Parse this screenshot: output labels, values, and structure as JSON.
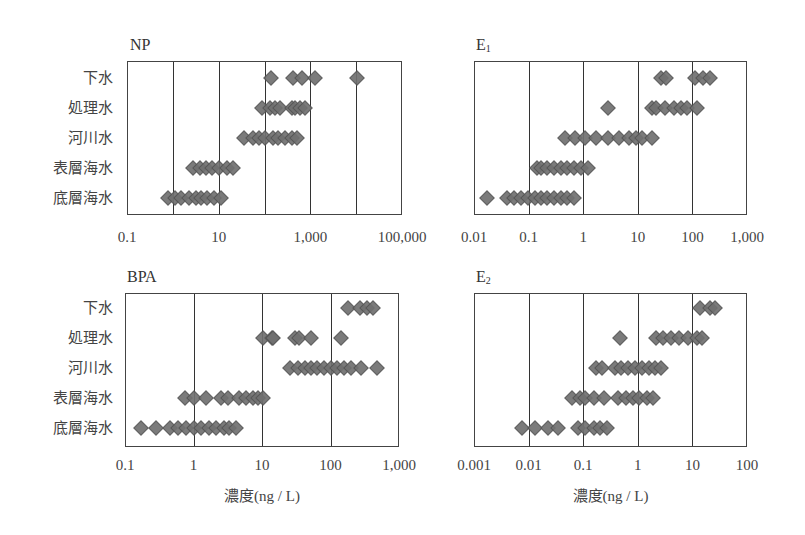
{
  "chart_data": [
    {
      "type": "scatter",
      "title": "NP",
      "xscale": "log",
      "xlim": [
        0.1,
        100000
      ],
      "xticks": [
        "0.1",
        "10",
        "1,000",
        "100,000"
      ],
      "gridlines": [
        0.1,
        1,
        10,
        100,
        1000,
        10000,
        100000
      ],
      "xlabel": "",
      "categories": [
        "下水",
        "処理水",
        "河川水",
        "表層海水",
        "底層海水"
      ],
      "series": [
        {
          "name": "下水",
          "values": [
            140,
            420,
            660,
            1260,
            10500
          ]
        },
        {
          "name": "処理水",
          "values": [
            90,
            130,
            170,
            220,
            400,
            470,
            600,
            770
          ]
        },
        {
          "name": "河川水",
          "values": [
            35,
            55,
            74,
            105,
            150,
            200,
            280,
            400,
            510
          ]
        },
        {
          "name": "表層海水",
          "values": [
            2.7,
            3.9,
            5.2,
            7.3,
            10,
            15,
            21
          ]
        },
        {
          "name": "底層海水",
          "values": [
            0.8,
            1.1,
            1.5,
            2.2,
            3.2,
            4.1,
            5.7,
            7.8,
            11
          ]
        }
      ]
    },
    {
      "type": "scatter",
      "title": "E1",
      "xscale": "log",
      "xlim": [
        0.01,
        1000
      ],
      "xticks": [
        "0.01",
        "0.1",
        "1",
        "10",
        "100",
        "1,000"
      ],
      "gridlines": [
        0.01,
        0.1,
        1,
        10,
        100,
        1000
      ],
      "xlabel": "",
      "categories": [
        "下水",
        "処理水",
        "河川水",
        "表層海水",
        "底層海水"
      ],
      "series": [
        {
          "name": "下水",
          "values": [
            27,
            33,
            110,
            155,
            210
          ]
        },
        {
          "name": "処理水",
          "values": [
            2.9,
            18,
            22,
            31,
            47,
            63,
            81,
            120
          ]
        },
        {
          "name": "河川水",
          "values": [
            0.46,
            0.7,
            1.1,
            1.7,
            2.8,
            4.6,
            7.0,
            9.1,
            12,
            18
          ]
        },
        {
          "name": "表層海水",
          "values": [
            0.14,
            0.17,
            0.22,
            0.29,
            0.39,
            0.5,
            0.68,
            0.91,
            1.2
          ]
        },
        {
          "name": "底層海水",
          "values": [
            0.017,
            0.041,
            0.055,
            0.074,
            0.096,
            0.13,
            0.17,
            0.22,
            0.29,
            0.39,
            0.5,
            0.68
          ]
        }
      ]
    },
    {
      "type": "scatter",
      "title": "BPA",
      "xscale": "log",
      "xlim": [
        0.1,
        1000
      ],
      "xticks": [
        "0.1",
        "1",
        "10",
        "100",
        "1,000"
      ],
      "gridlines": [
        0.1,
        1,
        10,
        100,
        1000
      ],
      "xlabel": "濃度(ng / L)",
      "categories": [
        "下水",
        "処理水",
        "河川水",
        "表層海水",
        "底層海水"
      ],
      "series": [
        {
          "name": "下水",
          "values": [
            180,
            270,
            340,
            420
          ]
        },
        {
          "name": "処理水",
          "values": [
            10.5,
            14,
            14.5,
            30,
            35,
            52,
            140
          ]
        },
        {
          "name": "河川水",
          "values": [
            26,
            33,
            43,
            52,
            64,
            80,
            100,
            125,
            160,
            200,
            280,
            480
          ]
        },
        {
          "name": "表層海水",
          "values": [
            0.76,
            1.0,
            1.5,
            2.5,
            3.2,
            4.6,
            5.8,
            7.3,
            8.6,
            10.5
          ]
        },
        {
          "name": "底層海水",
          "values": [
            0.17,
            0.28,
            0.46,
            0.6,
            0.79,
            1.0,
            1.3,
            1.7,
            2.1,
            2.8,
            3.3,
            4.2
          ]
        }
      ]
    },
    {
      "type": "scatter",
      "title": "E2",
      "xscale": "log",
      "xlim": [
        0.001,
        100
      ],
      "xticks": [
        "0.001",
        "0.01",
        "0.1",
        "1",
        "10",
        "100"
      ],
      "gridlines": [
        0.001,
        0.01,
        0.1,
        1,
        10,
        100
      ],
      "xlabel": "濃度(ng / L)",
      "categories": [
        "下水",
        "処理水",
        "河川水",
        "表層海水",
        "底層海水"
      ],
      "series": [
        {
          "name": "下水",
          "values": [
            14,
            21,
            26
          ]
        },
        {
          "name": "処理水",
          "values": [
            0.47,
            2.2,
            2.9,
            4.0,
            5.6,
            8.4,
            12,
            15
          ]
        },
        {
          "name": "河川水",
          "values": [
            0.17,
            0.22,
            0.39,
            0.5,
            0.67,
            0.9,
            1.2,
            1.6,
            2.1,
            2.7
          ]
        },
        {
          "name": "表層海水",
          "values": [
            0.063,
            0.088,
            0.11,
            0.16,
            0.24,
            0.44,
            0.62,
            0.83,
            1.05,
            1.5,
            1.9
          ]
        },
        {
          "name": "底層海水",
          "values": [
            0.0075,
            0.013,
            0.023,
            0.035,
            0.08,
            0.11,
            0.16,
            0.2,
            0.27
          ]
        }
      ]
    }
  ],
  "panels": [
    {
      "title_main": "NP",
      "title_sub": ""
    },
    {
      "title_main": "E",
      "title_sub": "1"
    },
    {
      "title_main": "BPA",
      "title_sub": ""
    },
    {
      "title_main": "E",
      "title_sub": "2"
    }
  ],
  "row_labels": [
    "下水",
    "処理水",
    "河川水",
    "表層海水",
    "底層海水"
  ],
  "axis_title": "濃度(ng / L)",
  "colors": {
    "marker_fill": "#707070",
    "marker_edge": "#555555",
    "frame": "#444444"
  }
}
